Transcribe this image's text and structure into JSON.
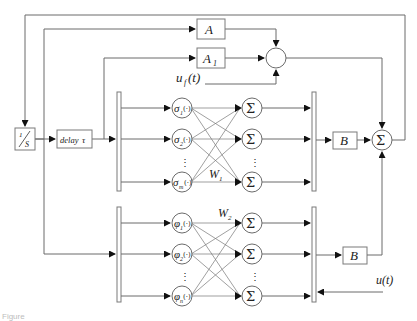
{
  "diagram": {
    "blocks": {
      "integrator": {
        "label": "1/s",
        "num": "1",
        "den": "S"
      },
      "delay": {
        "label": "delay τ",
        "word": "delay",
        "sym": "τ"
      },
      "A": {
        "label": "A"
      },
      "A1": {
        "label": "A",
        "sub": "1"
      },
      "B_upper": {
        "label": "B"
      },
      "B_lower": {
        "label": "B"
      },
      "sum_main": {
        "label": "Σ"
      },
      "sum_top": {
        "label": ""
      }
    },
    "signals": {
      "uf": {
        "label": "u",
        "sub": "f",
        "arg": "(t)"
      },
      "u": {
        "label": "u(t)"
      }
    },
    "upper_network": {
      "hidden_nodes": [
        {
          "label": "σ",
          "sub": "1",
          "suffix": "(·)"
        },
        {
          "label": "σ",
          "sub": "2",
          "suffix": "(·)"
        },
        {
          "label": "σ",
          "sub": "m",
          "suffix": "(·)"
        }
      ],
      "output_nodes": [
        "Σ",
        "Σ",
        "Σ"
      ],
      "weight": {
        "label": "W",
        "sub": "1"
      },
      "ellipsis": "⋮"
    },
    "lower_network": {
      "hidden_nodes": [
        {
          "label": "φ",
          "sub": "1",
          "suffix": "(·)"
        },
        {
          "label": "φ",
          "sub": "2",
          "suffix": "(·)"
        },
        {
          "label": "φ",
          "sub": "n",
          "suffix": "(·)"
        }
      ],
      "output_nodes": [
        "Σ",
        "Σ",
        "Σ"
      ],
      "weight": {
        "label": "W",
        "sub": "2"
      },
      "ellipsis": "⋮"
    },
    "caption": "Figure"
  }
}
